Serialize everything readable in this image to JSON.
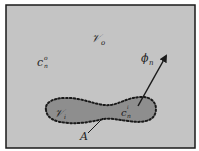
{
  "figure": {
    "background_color": "#c4c4c4",
    "frame_color": "#1a1a1a",
    "region_fill": "#8e8e8e",
    "labels": {
      "outer_volume": "𝒱",
      "outer_volume_sub": "o",
      "outer_concentration": "c",
      "outer_concentration_sup": "o",
      "outer_concentration_sub": "n",
      "flux": "ϕ",
      "flux_sub": "n",
      "inner_volume": "𝒱",
      "inner_volume_sub": "i",
      "inner_concentration": "c",
      "inner_concentration_sup": "i",
      "inner_concentration_sub": "n",
      "interface": "A"
    }
  }
}
